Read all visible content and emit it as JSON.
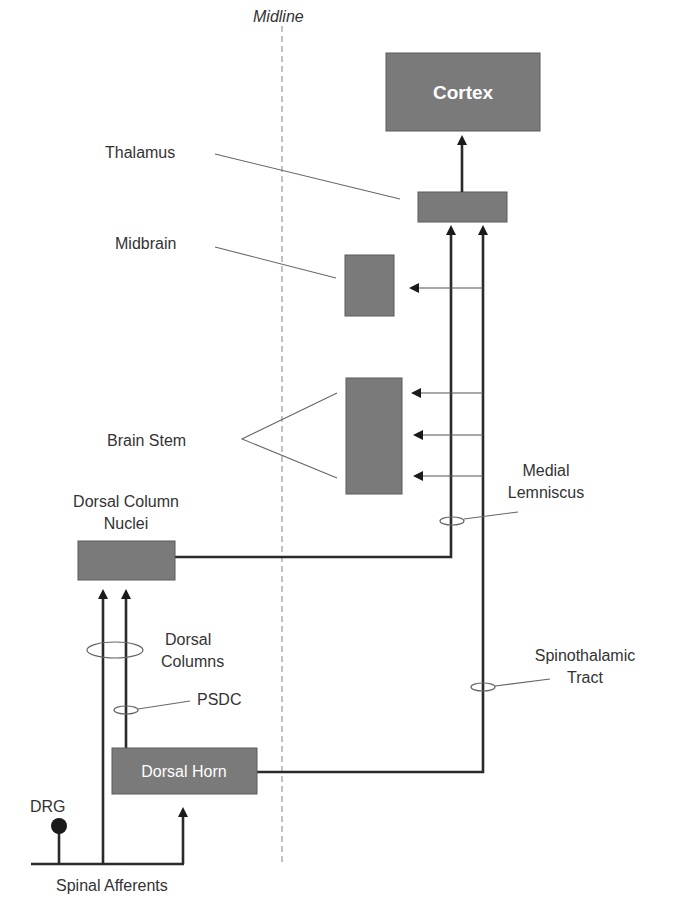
{
  "diagram": {
    "midline_label": "Midline",
    "nodes": {
      "cortex": "Cortex",
      "thalamus": "",
      "midbrain": "",
      "brain_stem": "",
      "dorsal_column_nuclei": "",
      "dorsal_horn": "Dorsal Horn",
      "drg": ""
    },
    "labels": {
      "thalamus": "Thalamus",
      "midbrain": "Midbrain",
      "brain_stem": "Brain Stem",
      "dorsal_column_nuclei_line1": "Dorsal Column",
      "dorsal_column_nuclei_line2": "Nuclei",
      "medial_lemniscus_line1": "Medial",
      "medial_lemniscus_line2": "Lemniscus",
      "dorsal_columns_line1": "Dorsal",
      "dorsal_columns_line2": "Columns",
      "psdc": "PSDC",
      "spinothalamic_line1": "Spinothalamic",
      "spinothalamic_line2": "Tract",
      "drg": "DRG",
      "spinal_afferents": "Spinal Afferents"
    },
    "colors": {
      "box_fill": "#7a7a7a",
      "line": "#2a2a2a",
      "leader": "#666666",
      "midline": "#999999",
      "text": "#333333"
    }
  }
}
